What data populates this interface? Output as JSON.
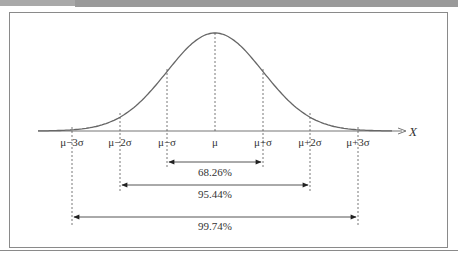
{
  "header": {
    "title": ""
  },
  "chart_data": {
    "type": "diagram",
    "axis_label": "X",
    "ticks": [
      "μ−3σ",
      "μ−2σ",
      "μ−σ",
      "μ",
      "μ+σ",
      "μ+2σ",
      "μ+3σ"
    ],
    "intervals": [
      {
        "range": "μ±σ",
        "label": "68.26%"
      },
      {
        "range": "μ±2σ",
        "label": "95.44%"
      },
      {
        "range": "μ±3σ",
        "label": "99.74%"
      }
    ]
  },
  "labels": {
    "t0": "μ−3σ",
    "t1": "μ−2σ",
    "t2": "μ−σ",
    "t3": "μ",
    "t4": "μ+σ",
    "t5": "μ+2σ",
    "t6": "μ+3σ",
    "axis": "X",
    "p1": "68.26%",
    "p2": "95.44%",
    "p3": "99.74%"
  }
}
